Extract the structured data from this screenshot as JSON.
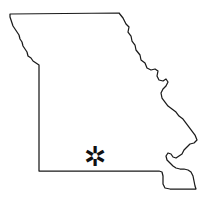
{
  "figure": {
    "kind": "state-outline-map",
    "width": 214,
    "height": 197,
    "background_color": "#ffffff",
    "outline_color": "#1a1a1a",
    "outline_fill": "#ffffff",
    "outline_width_px": 1.25
  },
  "marker": {
    "glyph": "✲",
    "name": "location-asterisk",
    "color": "#111111",
    "size_px": 27,
    "center_x": 95,
    "center_y": 156
  },
  "geometry": {
    "state_path": "M 10 14 L 119 13 L 123 18 L 126 24 L 129 27 L 128 32 L 131 36 L 132 41 L 135 45 L 136 50 L 140 55 L 141 60 L 145 63 L 147 68 L 151 70 L 155 69 L 158 71 L 157 76 L 159 80 L 163 81 L 166 79 L 168 82 L 166 86 L 163 89 L 161 93 L 162 98 L 165 102 L 168 106 L 172 109 L 176 112 L 179 116 L 183 119 L 186 123 L 189 127 L 192 131 L 195 135 L 197 140 L 194 143 L 190 144 L 187 147 L 184 150 L 182 154 L 179 156 L 176 158 L 173 157 L 171 154 L 168 153 L 166 156 L 167 160 L 170 163 L 173 166 L 176 168 L 180 169 L 184 169 L 188 170 L 191 172 L 193 176 L 194 181 L 195 186 L 196 189 L 190 189 L 183 189 L 176 189 L 170 189 L 165 188 L 163 184 L 163 180 L 163 176 L 162 172 L 159 171 L 155 171 L 150 171 L 144 171 L 137 171 L 129 171 L 120 171 L 110 171 L 100 171 L 90 171 L 80 171 L 70 171 L 60 171 L 51 171 L 44 171 L 39 171 L 39 160 L 39 148 L 39 136 L 39 124 L 39 112 L 39 100 L 39 88 L 39 78 L 39 70 L 39 65 L 36 63 L 33 61 L 31 58 L 28 56 L 27 52 L 25 49 L 23 46 L 22 42 L 20 39 L 19 35 L 17 32 L 15 29 L 13 26 L 12 23 L 11 20 L 10 17 Z",
    "north_border_y": 14,
    "west_border_x": 39,
    "south_border_y": 171,
    "bootheel_bottom_y": 189,
    "east_extreme_x": 197
  }
}
